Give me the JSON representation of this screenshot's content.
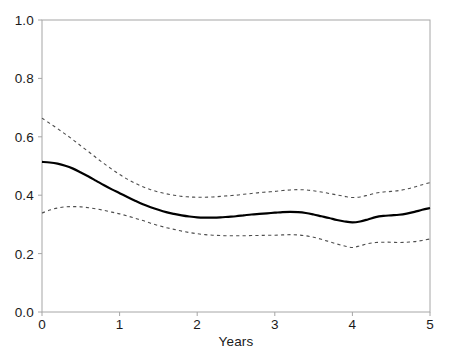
{
  "chart_data": {
    "type": "line",
    "title": "",
    "subtitle": "",
    "xlabel": "Years",
    "ylabel": "",
    "xlim": [
      0,
      5
    ],
    "ylim": [
      0,
      1.0
    ],
    "xticks": [
      0,
      1,
      2,
      3,
      4,
      5
    ],
    "xticklabels": [
      "0",
      "1",
      "2",
      "3",
      "4",
      "5"
    ],
    "yticks": [
      0.0,
      0.2,
      0.4,
      0.6,
      0.8,
      1.0
    ],
    "yticklabels": [
      "0.0",
      "0.2",
      "0.4",
      "0.6",
      "0.8",
      "1.0"
    ],
    "grid": false,
    "legend": null,
    "annotations": [],
    "colors": {
      "estimate": "#000000",
      "confidence_band": "#4d4d4d",
      "axis": "#999999",
      "text": "#1a1a1a",
      "background": "#ffffff"
    },
    "x": [
      0.0,
      0.1,
      0.2,
      0.3,
      0.4,
      0.5,
      0.6,
      0.7,
      0.8,
      0.9,
      1.0,
      1.1,
      1.2,
      1.3,
      1.4,
      1.5,
      1.6,
      1.7,
      1.8,
      1.9,
      2.0,
      2.1,
      2.2,
      2.3,
      2.4,
      2.5,
      2.6,
      2.7,
      2.8,
      2.9,
      3.0,
      3.1,
      3.2,
      3.3,
      3.4,
      3.5,
      3.6,
      3.7,
      3.8,
      3.9,
      4.0,
      4.1,
      4.2,
      4.3,
      4.4,
      4.5,
      4.6,
      4.7,
      4.8,
      4.9,
      5.0
    ],
    "series": [
      {
        "name": "Upper confidence limit",
        "style": "dashed",
        "values": [
          0.664,
          0.646,
          0.628,
          0.609,
          0.59,
          0.569,
          0.549,
          0.528,
          0.508,
          0.489,
          0.471,
          0.455,
          0.441,
          0.429,
          0.419,
          0.411,
          0.405,
          0.4,
          0.396,
          0.394,
          0.393,
          0.393,
          0.394,
          0.396,
          0.398,
          0.4,
          0.403,
          0.406,
          0.409,
          0.411,
          0.413,
          0.416,
          0.418,
          0.419,
          0.418,
          0.415,
          0.411,
          0.406,
          0.401,
          0.396,
          0.392,
          0.394,
          0.4,
          0.407,
          0.411,
          0.413,
          0.416,
          0.421,
          0.428,
          0.436,
          0.443
        ]
      },
      {
        "name": "Estimate",
        "style": "solid",
        "values": [
          0.514,
          0.512,
          0.508,
          0.501,
          0.491,
          0.478,
          0.464,
          0.449,
          0.434,
          0.42,
          0.407,
          0.394,
          0.381,
          0.369,
          0.359,
          0.35,
          0.342,
          0.336,
          0.331,
          0.327,
          0.324,
          0.323,
          0.323,
          0.324,
          0.326,
          0.328,
          0.331,
          0.334,
          0.336,
          0.338,
          0.34,
          0.342,
          0.343,
          0.342,
          0.339,
          0.334,
          0.328,
          0.322,
          0.315,
          0.31,
          0.307,
          0.31,
          0.317,
          0.325,
          0.329,
          0.331,
          0.333,
          0.337,
          0.343,
          0.35,
          0.356
        ]
      },
      {
        "name": "Lower confidence limit",
        "style": "dashed",
        "values": [
          0.339,
          0.349,
          0.356,
          0.36,
          0.361,
          0.36,
          0.357,
          0.353,
          0.348,
          0.342,
          0.336,
          0.329,
          0.321,
          0.313,
          0.304,
          0.296,
          0.289,
          0.283,
          0.277,
          0.272,
          0.268,
          0.265,
          0.263,
          0.262,
          0.261,
          0.261,
          0.261,
          0.262,
          0.262,
          0.263,
          0.263,
          0.264,
          0.265,
          0.264,
          0.261,
          0.256,
          0.249,
          0.241,
          0.233,
          0.226,
          0.221,
          0.227,
          0.234,
          0.238,
          0.239,
          0.239,
          0.238,
          0.239,
          0.241,
          0.245,
          0.25
        ]
      }
    ]
  },
  "axes": {
    "plot_left_px": 42,
    "plot_right_px": 430,
    "plot_top_px": 20,
    "plot_bottom_px": 312
  }
}
